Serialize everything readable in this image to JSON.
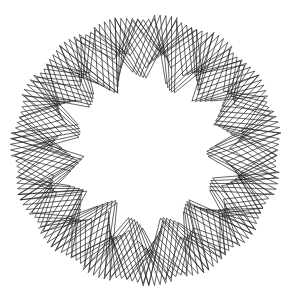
{
  "figure": {
    "title": "",
    "type": "spirograph-line-art",
    "stroke_color": "#222222",
    "background": "#ffffff",
    "center": [
      146,
      150
    ],
    "outer_radius": 136,
    "inner_radius": 58,
    "lobes": 6,
    "points": 420,
    "step_degrees": 13.2,
    "stroke_width": 0.7
  }
}
